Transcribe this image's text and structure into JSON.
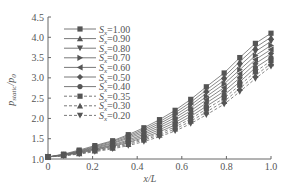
{
  "chart_data": {
    "type": "line",
    "title": "",
    "xlabel": "x/L",
    "ylabel": "p_static/p_0",
    "xlim": [
      0,
      1.0
    ],
    "ylim": [
      1.0,
      4.5
    ],
    "xticks": [
      "0",
      "0.2",
      "0.4",
      "0.6",
      "0.8",
      "1.0"
    ],
    "yticks": [
      "1.0",
      "1.5",
      "2.0",
      "2.5",
      "3.0",
      "3.5",
      "4.0",
      "4.5"
    ],
    "grid": false,
    "legend_position": "top-left",
    "x": [
      0,
      0.07,
      0.14,
      0.21,
      0.29,
      0.36,
      0.43,
      0.5,
      0.57,
      0.64,
      0.71,
      0.79,
      0.86,
      0.93,
      1.0
    ],
    "series": [
      {
        "name": "S_x=1.00",
        "marker": "square",
        "dash": false,
        "values": [
          1.05,
          1.12,
          1.22,
          1.33,
          1.45,
          1.6,
          1.77,
          1.97,
          2.2,
          2.47,
          2.78,
          3.12,
          3.5,
          3.85,
          4.1
        ]
      },
      {
        "name": "S_x=0.90",
        "marker": "triangle-up",
        "dash": false,
        "values": [
          1.05,
          1.11,
          1.2,
          1.31,
          1.43,
          1.57,
          1.73,
          1.92,
          2.14,
          2.4,
          2.7,
          3.03,
          3.4,
          3.75,
          4.0
        ]
      },
      {
        "name": "S_x=0.80",
        "marker": "triangle-down",
        "dash": false,
        "values": [
          1.05,
          1.11,
          1.19,
          1.29,
          1.4,
          1.54,
          1.69,
          1.87,
          2.08,
          2.33,
          2.62,
          2.94,
          3.3,
          3.65,
          3.9
        ]
      },
      {
        "name": "S_x=0.70",
        "marker": "triangle-right",
        "dash": false,
        "values": [
          1.05,
          1.1,
          1.18,
          1.27,
          1.38,
          1.51,
          1.65,
          1.82,
          2.02,
          2.26,
          2.54,
          2.85,
          3.2,
          3.55,
          3.8
        ]
      },
      {
        "name": "S_x=0.60",
        "marker": "triangle-left",
        "dash": false,
        "values": [
          1.05,
          1.1,
          1.17,
          1.25,
          1.35,
          1.47,
          1.61,
          1.77,
          1.96,
          2.19,
          2.46,
          2.76,
          3.1,
          3.45,
          3.7
        ]
      },
      {
        "name": "S_x=0.50",
        "marker": "diamond",
        "dash": false,
        "values": [
          1.05,
          1.09,
          1.16,
          1.24,
          1.33,
          1.44,
          1.57,
          1.72,
          1.9,
          2.12,
          2.38,
          2.67,
          3.0,
          3.35,
          3.6
        ]
      },
      {
        "name": "S_x=0.40",
        "marker": "circle",
        "dash": false,
        "values": [
          1.05,
          1.09,
          1.15,
          1.22,
          1.31,
          1.41,
          1.53,
          1.67,
          1.84,
          2.05,
          2.3,
          2.58,
          2.9,
          3.25,
          3.5
        ]
      },
      {
        "name": "S_x=0.35",
        "marker": "square",
        "dash": true,
        "values": [
          1.05,
          1.09,
          1.14,
          1.21,
          1.29,
          1.39,
          1.5,
          1.63,
          1.79,
          1.99,
          2.23,
          2.5,
          2.82,
          3.15,
          3.42
        ]
      },
      {
        "name": "S_x=0.30",
        "marker": "triangle-up",
        "dash": true,
        "values": [
          1.05,
          1.08,
          1.13,
          1.2,
          1.27,
          1.36,
          1.47,
          1.59,
          1.74,
          1.93,
          2.16,
          2.42,
          2.74,
          3.06,
          3.35
        ]
      },
      {
        "name": "S_x=0.20",
        "marker": "triangle-down",
        "dash": true,
        "values": [
          1.05,
          1.08,
          1.12,
          1.18,
          1.25,
          1.33,
          1.43,
          1.55,
          1.69,
          1.87,
          2.09,
          2.35,
          2.66,
          2.98,
          3.28
        ]
      }
    ],
    "legend": [
      {
        "prefix": "S",
        "sub": "x",
        "value": "=1.00"
      },
      {
        "prefix": "S",
        "sub": "x",
        "value": "=0.90"
      },
      {
        "prefix": "S",
        "sub": "x",
        "value": "=0.80"
      },
      {
        "prefix": "S",
        "sub": "x",
        "value": "=0.70"
      },
      {
        "prefix": "S",
        "sub": "x",
        "value": "=0.60"
      },
      {
        "prefix": "S",
        "sub": "x",
        "value": "=0.50"
      },
      {
        "prefix": "S",
        "sub": "x",
        "value": "=0.40"
      },
      {
        "prefix": "S",
        "sub": "x",
        "value": "=0.35"
      },
      {
        "prefix": "S",
        "sub": "x",
        "value": "=0.30"
      },
      {
        "prefix": "S",
        "sub": "x",
        "value": "=0.20"
      }
    ],
    "colors": {
      "line": "#6a6a6a",
      "marker": "#555555",
      "axis": "#666666",
      "text": "#555555"
    }
  }
}
